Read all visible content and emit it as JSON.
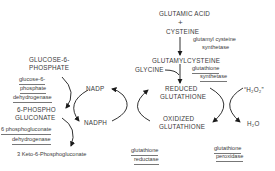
{
  "diagram": {
    "nodes": {
      "glutamic_acid": "GLUTAMIC ACID",
      "plus": "+",
      "cysteine": "CYSTEINE",
      "glutamylcysteine": "GLUTAMYLCYSTEINE",
      "glycine": "GLYCINE",
      "reduced_glutathione_1": "REDUCED",
      "reduced_glutathione_2": "GLUTATHIONE",
      "oxidized_glutathione_1": "OXIDIZED",
      "oxidized_glutathione_2": "GLUTATHIONE",
      "h2o2": "“H₂O₂”",
      "h2o": "H₂O",
      "glucose6p_1": "GLUCOSE-6-",
      "glucose6p_2": "PHOSPHATE",
      "phosphogluconate_1": "6-PHOSPHO",
      "phosphogluconate_2": "GLUCONATE",
      "nadp": "NADP",
      "nadph": "NADPH",
      "keto": "3 Keto-6-Phosphogluconate"
    },
    "enzymes": {
      "gcs_1": "glutamyl cysteine",
      "gcs_2": "synthetase",
      "gs_1": "glutathione",
      "gs_2": "synthetase",
      "g6pd_1": "glucose-6-",
      "g6pd_2": "phosphate",
      "g6pd_3": "dehydrogenase",
      "pgd_1": "6 phosphogluconate",
      "pgd_2": "dehydrogenase",
      "gr_1": "glutathione",
      "gr_2": "reductase",
      "gpx_1": "glutathione",
      "gpx_2": "peroxidase"
    },
    "colors": {
      "text": "#3a3a3a",
      "line": "#1a1a1a"
    }
  }
}
